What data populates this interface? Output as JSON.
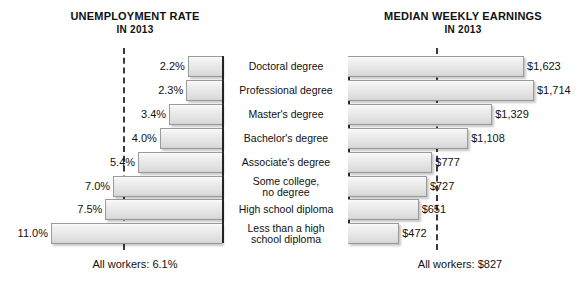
{
  "left_panel": {
    "title_line1": "UNEMPLOYMENT RATE",
    "title_line2": "IN 2013",
    "footer": "All workers: 6.1%",
    "average_value": 6.1
  },
  "right_panel": {
    "title_line1": "MEDIAN WEEKLY EARNINGS",
    "title_line2": "IN 2013",
    "footer": "All workers: $827",
    "average_value": 827
  },
  "categories": [
    {
      "line1": "Doctoral degree",
      "line2": ""
    },
    {
      "line1": "Professional degree",
      "line2": ""
    },
    {
      "line1": "Master's degree",
      "line2": ""
    },
    {
      "line1": "Bachelor's degree",
      "line2": ""
    },
    {
      "line1": "Associate's degree",
      "line2": ""
    },
    {
      "line1": "Some college,",
      "line2": "no degree"
    },
    {
      "line1": "High school diploma",
      "line2": ""
    },
    {
      "line1": "Less than a high",
      "line2": "school diploma"
    }
  ],
  "unemployment_labels": [
    "2.2%",
    "2.3%",
    "3.4%",
    "4.0%",
    "5.4%",
    "7.0%",
    "7.5%",
    "11.0%"
  ],
  "earnings_labels": [
    "$1,623",
    "$1,714",
    "$1,329",
    "$1,108",
    "$777",
    "$727",
    "$651",
    "$472"
  ],
  "colors": {
    "bar_fill_light": "#f4f4f4",
    "bar_fill_dark": "#d2d2d2",
    "bar_border": "#9a9a9a",
    "axis": "#2b2b2b",
    "text": "#111111",
    "background": "#ffffff"
  },
  "chart_data": [
    {
      "type": "bar",
      "title": "UNEMPLOYMENT RATE IN 2013",
      "orientation": "horizontal-left",
      "xlabel": "Unemployment rate (%)",
      "ylabel": "",
      "categories": [
        "Doctoral degree",
        "Professional degree",
        "Master's degree",
        "Bachelor's degree",
        "Associate's degree",
        "Some college, no degree",
        "High school diploma",
        "Less than a high school diploma"
      ],
      "values": [
        2.2,
        2.3,
        3.4,
        4.0,
        5.4,
        7.0,
        7.5,
        11.0
      ],
      "data_labels": [
        "2.2%",
        "2.3%",
        "3.4%",
        "4.0%",
        "5.4%",
        "7.0%",
        "7.5%",
        "11.0%"
      ],
      "xlim": [
        0,
        11.5
      ],
      "grid": false,
      "legend": "none",
      "annotations": [
        {
          "text": "All workers: 6.1%",
          "type": "reference-line",
          "value": 6.1,
          "style": "dashed"
        }
      ]
    },
    {
      "type": "bar",
      "title": "MEDIAN WEEKLY EARNINGS IN 2013",
      "orientation": "horizontal-right",
      "xlabel": "Median weekly earnings (USD)",
      "ylabel": "",
      "categories": [
        "Doctoral degree",
        "Professional degree",
        "Master's degree",
        "Bachelor's degree",
        "Associate's degree",
        "Some college, no degree",
        "High school diploma",
        "Less than a high school diploma"
      ],
      "values": [
        1623,
        1714,
        1329,
        1108,
        777,
        727,
        651,
        472
      ],
      "data_labels": [
        "$1,623",
        "$1,714",
        "$1,329",
        "$1,108",
        "$777",
        "$727",
        "$651",
        "$472"
      ],
      "xlim": [
        0,
        1800
      ],
      "grid": false,
      "legend": "none",
      "annotations": [
        {
          "text": "All workers: $827",
          "type": "reference-line",
          "value": 827,
          "style": "dashed"
        }
      ]
    }
  ]
}
